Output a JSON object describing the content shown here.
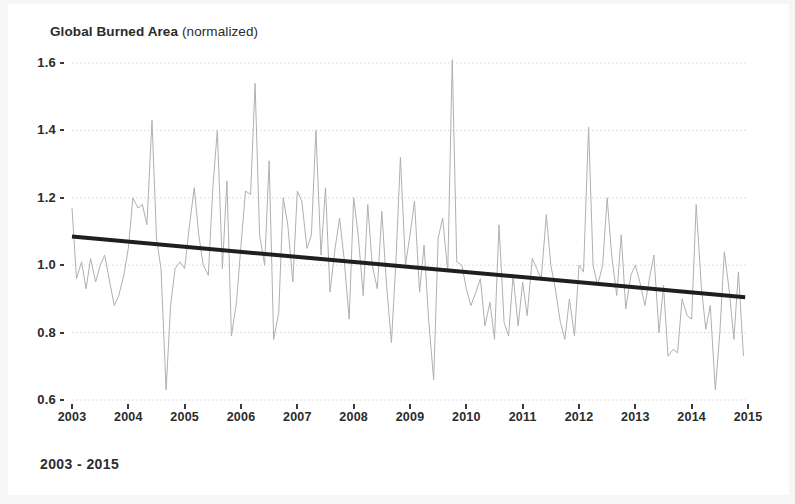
{
  "title": {
    "bold": "Global Burned Area",
    "regular": " (normalized)"
  },
  "caption": "2003 - 2015",
  "colors": {
    "series_line": "#b0b0b0",
    "trend_line": "#1f1f1f",
    "gridline": "#d8d8d8",
    "axis_text": "#2b2b2b",
    "background": "#ffffff",
    "page_edge": "#f6f6f6"
  },
  "chart_data": {
    "type": "line",
    "title": "Global Burned Area (normalized)",
    "subtitle": "2003 - 2015",
    "xlabel": "",
    "ylabel": "Global Burned Area (normalized)",
    "xlim": [
      2003.0,
      2015.0
    ],
    "ylim": [
      0.6,
      1.6
    ],
    "xticks": [
      2003,
      2004,
      2005,
      2006,
      2007,
      2008,
      2009,
      2010,
      2011,
      2012,
      2013,
      2014,
      2015
    ],
    "xtick_labels": [
      "2003",
      "2004",
      "2005",
      "2006",
      "2007",
      "2008",
      "2009",
      "2010",
      "2011",
      "2012",
      "2013",
      "2014",
      "2015"
    ],
    "yticks": [
      0.6,
      0.8,
      1.0,
      1.2,
      1.4,
      1.6
    ],
    "ytick_labels": [
      "0.6",
      "0.8",
      "1.0",
      "1.2",
      "1.4",
      "1.6"
    ],
    "grid": true,
    "grid_style": "dotted-horizontal",
    "legend": null,
    "legend_position": "none",
    "series": [
      {
        "name": "Global burned area (monthly, normalized)",
        "color": "#b0b0b0",
        "line_width": 1,
        "x": [
          2003.0,
          2003.08,
          2003.17,
          2003.25,
          2003.33,
          2003.42,
          2003.5,
          2003.58,
          2003.67,
          2003.75,
          2003.83,
          2003.92,
          2004.0,
          2004.08,
          2004.17,
          2004.25,
          2004.33,
          2004.42,
          2004.5,
          2004.58,
          2004.67,
          2004.75,
          2004.83,
          2004.92,
          2005.0,
          2005.08,
          2005.17,
          2005.25,
          2005.33,
          2005.42,
          2005.5,
          2005.58,
          2005.67,
          2005.75,
          2005.83,
          2005.92,
          2006.0,
          2006.08,
          2006.17,
          2006.25,
          2006.33,
          2006.42,
          2006.5,
          2006.58,
          2006.67,
          2006.75,
          2006.83,
          2006.92,
          2007.0,
          2007.08,
          2007.17,
          2007.25,
          2007.33,
          2007.42,
          2007.5,
          2007.58,
          2007.67,
          2007.75,
          2007.83,
          2007.92,
          2008.0,
          2008.08,
          2008.17,
          2008.25,
          2008.33,
          2008.42,
          2008.5,
          2008.58,
          2008.67,
          2008.75,
          2008.83,
          2008.92,
          2009.0,
          2009.08,
          2009.17,
          2009.25,
          2009.33,
          2009.42,
          2009.5,
          2009.58,
          2009.67,
          2009.75,
          2009.83,
          2009.92,
          2010.0,
          2010.08,
          2010.17,
          2010.25,
          2010.33,
          2010.42,
          2010.5,
          2010.58,
          2010.67,
          2010.75,
          2010.83,
          2010.92,
          2011.0,
          2011.08,
          2011.17,
          2011.25,
          2011.33,
          2011.42,
          2011.5,
          2011.58,
          2011.67,
          2011.75,
          2011.83,
          2011.92,
          2012.0,
          2012.08,
          2012.17,
          2012.25,
          2012.33,
          2012.42,
          2012.5,
          2012.58,
          2012.67,
          2012.75,
          2012.83,
          2012.92,
          2013.0,
          2013.08,
          2013.17,
          2013.25,
          2013.33,
          2013.42,
          2013.5,
          2013.58,
          2013.67,
          2013.75,
          2013.83,
          2013.92,
          2014.0,
          2014.08,
          2014.17,
          2014.25,
          2014.33,
          2014.42,
          2014.5,
          2014.58,
          2014.67,
          2014.75,
          2014.83,
          2014.92
        ],
        "y": [
          1.17,
          0.96,
          1.01,
          0.93,
          1.02,
          0.95,
          1.0,
          1.03,
          0.95,
          0.88,
          0.91,
          0.97,
          1.05,
          1.2,
          1.17,
          1.18,
          1.12,
          1.43,
          1.08,
          0.99,
          0.63,
          0.88,
          0.99,
          1.01,
          0.99,
          1.11,
          1.23,
          1.09,
          1.0,
          0.97,
          1.23,
          1.4,
          0.99,
          1.25,
          0.79,
          0.89,
          1.06,
          1.22,
          1.21,
          1.54,
          1.09,
          1.0,
          1.31,
          0.78,
          0.86,
          1.2,
          1.12,
          0.95,
          1.22,
          1.19,
          1.05,
          1.09,
          1.4,
          1.03,
          1.23,
          0.92,
          1.05,
          1.14,
          1.02,
          0.84,
          1.2,
          1.09,
          0.91,
          1.18,
          1.0,
          0.93,
          1.16,
          0.95,
          0.77,
          1.01,
          1.32,
          1.0,
          1.09,
          1.19,
          0.92,
          1.06,
          0.84,
          0.66,
          1.08,
          1.14,
          0.98,
          1.61,
          1.01,
          1.0,
          0.93,
          0.88,
          0.92,
          0.96,
          0.82,
          0.89,
          0.78,
          1.12,
          0.83,
          0.79,
          0.97,
          0.82,
          0.95,
          0.85,
          1.02,
          0.99,
          0.96,
          1.15,
          1.0,
          0.93,
          0.83,
          0.78,
          0.9,
          0.79,
          1.0,
          0.98,
          1.41,
          1.0,
          0.94,
          1.0,
          1.2,
          1.03,
          0.91,
          1.09,
          0.87,
          0.97,
          1.0,
          0.95,
          0.88,
          0.96,
          1.03,
          0.8,
          0.94,
          0.73,
          0.75,
          0.74,
          0.9,
          0.85,
          0.84,
          1.18,
          0.94,
          0.81,
          0.88,
          0.63,
          0.8,
          1.04,
          0.92,
          0.78,
          0.98,
          0.73
        ]
      }
    ],
    "trendline": {
      "name": "Linear trend",
      "color": "#1f1f1f",
      "line_width": 4,
      "x": [
        2003.0,
        2014.95
      ],
      "y": [
        1.085,
        0.905
      ],
      "slope_per_year": -0.0151,
      "description": "Declining linear trend from ~1.085 in 2003 to ~0.905 in late 2014"
    }
  }
}
